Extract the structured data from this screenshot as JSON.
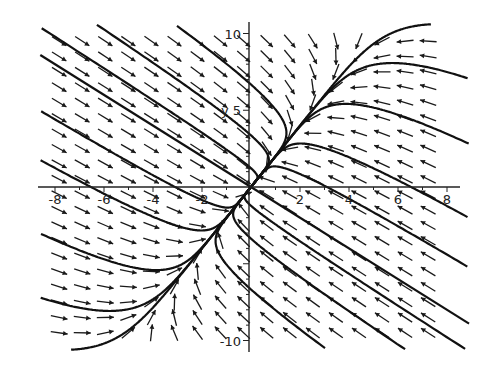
{
  "chart_data": {
    "type": "direction-field",
    "title": "",
    "xlabel": "",
    "ylabel": "y",
    "xlim": [
      -8,
      8
    ],
    "ylim": [
      -10,
      10
    ],
    "x_ticks": [
      -8,
      -6,
      -4,
      -2,
      2,
      4,
      6,
      8
    ],
    "x_tick_labels": [
      "-8",
      "-6",
      "-4",
      "-2",
      "2",
      "4",
      "6",
      "8"
    ],
    "y_ticks": [
      10,
      5,
      -10
    ],
    "y_tick_labels": [
      "10",
      "5",
      "-10"
    ],
    "grid": false,
    "system": {
      "description": "Linear system x' = A x with stable node; fast eigenvector (1,-1), slow eigenvector (1,2)",
      "A": [
        [
          -2.8333,
          1.1667
        ],
        [
          2.3333,
          -1.6667
        ]
      ],
      "eigen": [
        {
          "value": -0.5,
          "vector": [
            1,
            2
          ]
        },
        {
          "value": -4,
          "vector": [
            1,
            -1
          ]
        }
      ]
    },
    "field_grid": {
      "nx": 17,
      "ny": 20
    },
    "solution_curves": [
      {
        "a": 6.6,
        "b": 3.0
      },
      {
        "a": 5.2,
        "b": 3.0
      },
      {
        "a": 3.6,
        "b": 2.6
      },
      {
        "a": 2.0,
        "b": 2.2
      },
      {
        "a": 1.0,
        "b": 1.6
      },
      {
        "a": -1.0,
        "b": -1.6
      },
      {
        "a": -2.0,
        "b": -2.2
      },
      {
        "a": -3.6,
        "b": -2.6
      },
      {
        "a": -5.2,
        "b": -3.0
      },
      {
        "a": -6.6,
        "b": -3.0
      },
      {
        "a": 0.6,
        "b": -9.0
      },
      {
        "a": -0.6,
        "b": 9.0
      },
      {
        "a": 1.5,
        "b": -11.5
      },
      {
        "a": -1.5,
        "b": 11.5
      },
      {
        "a": 2.8,
        "b": -14.0
      },
      {
        "a": -2.8,
        "b": 14.0
      }
    ]
  }
}
